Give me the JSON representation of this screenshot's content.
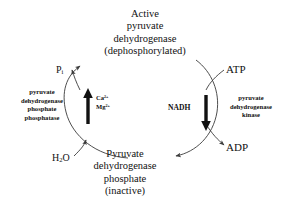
{
  "diagram": {
    "background_color": "#ffffff",
    "line_color": "#3a3a3a",
    "bold_arrow_color": "#111111",
    "text_color": "#1a1a1a"
  },
  "nodes": {
    "active": {
      "line1": "Active",
      "line2": "pyruvate",
      "line3": "dehydrogenase",
      "line4": "(dephosphorylated)"
    },
    "inactive": {
      "line1": "Pyruvate",
      "line2": "dehydrogenase",
      "line3": "phosphate",
      "line4": "(inactive)"
    }
  },
  "enzymes": {
    "phosphatase": {
      "line1": "pyruvate",
      "line2": "dehydrogenase",
      "line3": "phosphate",
      "line4": "phosphatase"
    },
    "kinase": {
      "line1": "pyruvate",
      "line2": "dehydrogenase",
      "line3": "kinase"
    }
  },
  "metabolites": {
    "phosphate_released": "P",
    "phosphate_subscript": "i",
    "water": "H",
    "water_subscript": "2",
    "water_tail": "O",
    "atp": "ATP",
    "adp": "ADP",
    "nadh": "NADH"
  },
  "regulators": {
    "calcium": "Ca",
    "calcium_charge": "2+",
    "magnesium": "Mg",
    "magnesium_charge": "2+"
  }
}
